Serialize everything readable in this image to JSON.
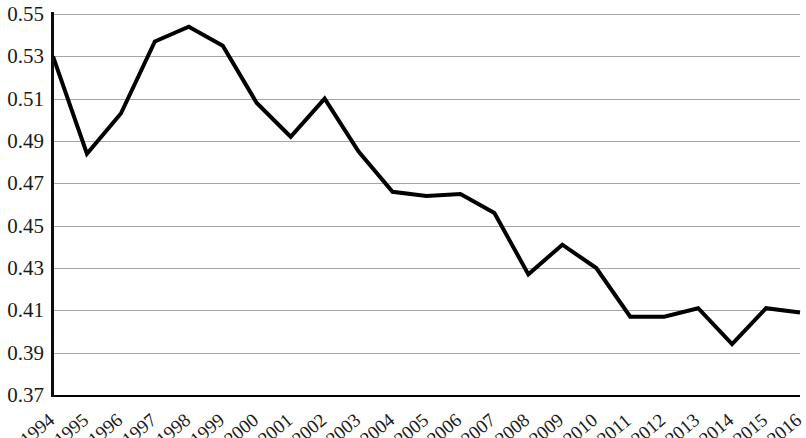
{
  "chart_data": {
    "type": "line",
    "title": "",
    "subtitle": "",
    "xlabel": "",
    "ylabel": "",
    "categories": [
      "1994",
      "1995",
      "1996",
      "1997",
      "1998",
      "1999",
      "2000",
      "2001",
      "2002",
      "2003",
      "2004",
      "2005",
      "2006",
      "2007",
      "2008",
      "2009",
      "2010",
      "2011",
      "2012",
      "2013",
      "2014",
      "2015",
      "2016"
    ],
    "series": [
      {
        "name": "",
        "values": [
          0.53,
          0.484,
          0.503,
          0.537,
          0.544,
          0.535,
          0.508,
          0.492,
          0.51,
          0.485,
          0.466,
          0.464,
          0.465,
          0.456,
          0.427,
          0.441,
          0.43,
          0.407,
          0.407,
          0.411,
          0.394,
          0.411,
          0.409
        ]
      }
    ],
    "ylim": [
      0.37,
      0.55
    ],
    "ytick_values": [
      0.55,
      0.53,
      0.51,
      0.49,
      0.47,
      0.45,
      0.43,
      0.41,
      0.39,
      0.37
    ],
    "ytick_labels": [
      "0.55",
      "0.53",
      "0.51",
      "0.49",
      "0.47",
      "0.45",
      "0.43",
      "0.41",
      "0.39",
      "0.37"
    ],
    "grid": "horizontal",
    "legend": "none",
    "line_color": "#000000",
    "line_width": 4,
    "gridline_color": "#a6a6a6",
    "axis_color": "#000000",
    "background_color": "#ffffff"
  }
}
